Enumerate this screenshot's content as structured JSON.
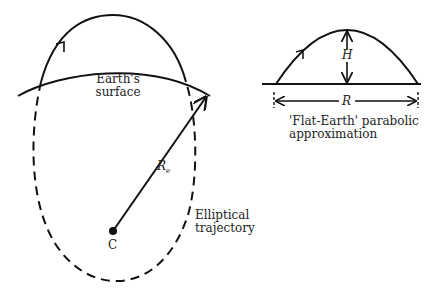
{
  "left_diagram": {
    "earth_surface_label": [
      "Earth's",
      "surface"
    ],
    "radius_label": "R",
    "radius_subscript": "e",
    "center_label": "C",
    "trajectory_label": [
      "Elliptical",
      "trajectory"
    ]
  },
  "right_diagram": {
    "height_label": "H",
    "range_label": "R",
    "caption": [
      "'Flat-Earth' parabolic",
      "approximation"
    ]
  },
  "colors": {
    "stroke": "#111111",
    "background": "#ffffff"
  }
}
